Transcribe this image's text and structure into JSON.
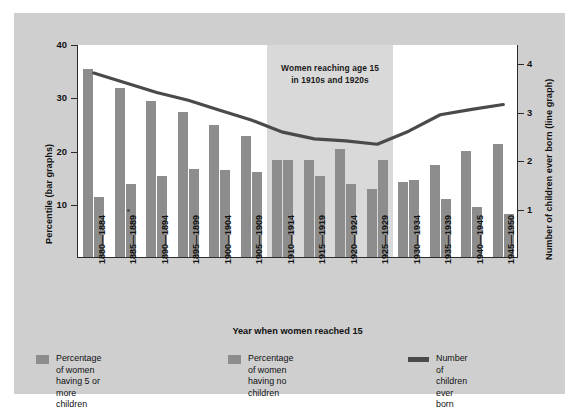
{
  "figure": {
    "panel_bg": "#cfcfcf",
    "plot_bg": "#ffffff",
    "band_bg": "#d9d9d9",
    "bar_color": "#8d8d8d",
    "line_color": "#4a4a4a",
    "axis_color": "#2b2b2b"
  },
  "annotation": {
    "line1": "Women reaching age 15",
    "line2": "in 1910s and 1920s"
  },
  "axes": {
    "left_title": "Percentile (bar graphs)",
    "right_title": "Number of children ever born (line graph)",
    "x_title": "Year when women reached 15",
    "left_ticks": [
      "10",
      "20",
      "30",
      "40"
    ],
    "right_ticks": [
      "1",
      "2",
      "3",
      "4"
    ]
  },
  "legend": {
    "items": [
      {
        "name": "five-or-more-children",
        "type": "bar",
        "label": "Percentage of women\nhaving 5 or more children"
      },
      {
        "name": "no-children",
        "type": "bar",
        "label": "Percentage of women\nhaving no children"
      },
      {
        "name": "children-ever-born",
        "type": "line",
        "label": "Number of children ever born"
      }
    ]
  },
  "chart_data": {
    "type": "bar",
    "title": "",
    "xlabel": "Year when women reached 15",
    "ylabel": "Percentile (bar graphs)",
    "y2label": "Number of children ever born (line graph)",
    "ylim": [
      0,
      40
    ],
    "y2lim": [
      0,
      4.4
    ],
    "yticks": [
      10,
      20,
      30,
      40
    ],
    "y2ticks": [
      1,
      2,
      3,
      4
    ],
    "grid": false,
    "legend_position": "bottom",
    "categories": [
      "1880—1884",
      "1885—1889",
      "1890—1894",
      "1895—1899",
      "1900—1904",
      "1905—1909",
      "1910—1914",
      "1915—1919",
      "1920—1924",
      "1925—1929",
      "1930—1934",
      "1935—1939",
      "1940—1945",
      "1945—1950"
    ],
    "series": [
      {
        "name": "Percentage of women having 5 or more children",
        "kind": "bar",
        "axis": "left",
        "values": [
          35.3,
          31.8,
          29.3,
          27.2,
          24.7,
          22.8,
          18.2,
          18.2,
          20.3,
          12.8,
          14.0,
          17.3,
          19.9,
          21.2
        ]
      },
      {
        "name": "Percentage of women having no children",
        "kind": "bar",
        "axis": "left",
        "values": [
          11.2,
          13.7,
          15.2,
          16.5,
          16.4,
          16.0,
          18.3,
          15.2,
          13.7,
          18.2,
          14.4,
          10.9,
          9.4,
          8.1
        ]
      },
      {
        "name": "Number of children ever born",
        "kind": "line",
        "axis": "right",
        "values": [
          3.82,
          3.62,
          3.42,
          3.26,
          3.05,
          2.85,
          2.6,
          2.46,
          2.42,
          2.35,
          2.62,
          2.96,
          3.07,
          3.17
        ]
      }
    ],
    "annotations": [
      {
        "text": "Women reaching age 15 in 1910s and 1920s",
        "span_categories": [
          "1910—1914",
          "1925—1929"
        ]
      }
    ]
  }
}
